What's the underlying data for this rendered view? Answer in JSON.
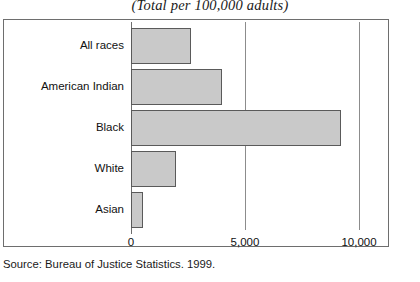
{
  "chart_data": {
    "type": "bar",
    "orientation": "horizontal",
    "title": "(Total per 100,000 adults)",
    "xlabel": "",
    "ylabel": "",
    "xlim": [
      0,
      11290
    ],
    "xticks": [
      0,
      5000,
      10000
    ],
    "xtick_labels": [
      "0",
      "5,000",
      "10,000"
    ],
    "grid": "vertical",
    "legend": "none",
    "categories": [
      "All races",
      "American Indian",
      "Black",
      "White",
      "Asian"
    ],
    "values": [
      2650,
      4000,
      9230,
      1975,
      530
    ],
    "bar_color": "#c9c9c9",
    "bar_edge_color": "#5a5a5a"
  },
  "source": {
    "text": "Source: Bureau of Justice Statistics. 1999."
  }
}
